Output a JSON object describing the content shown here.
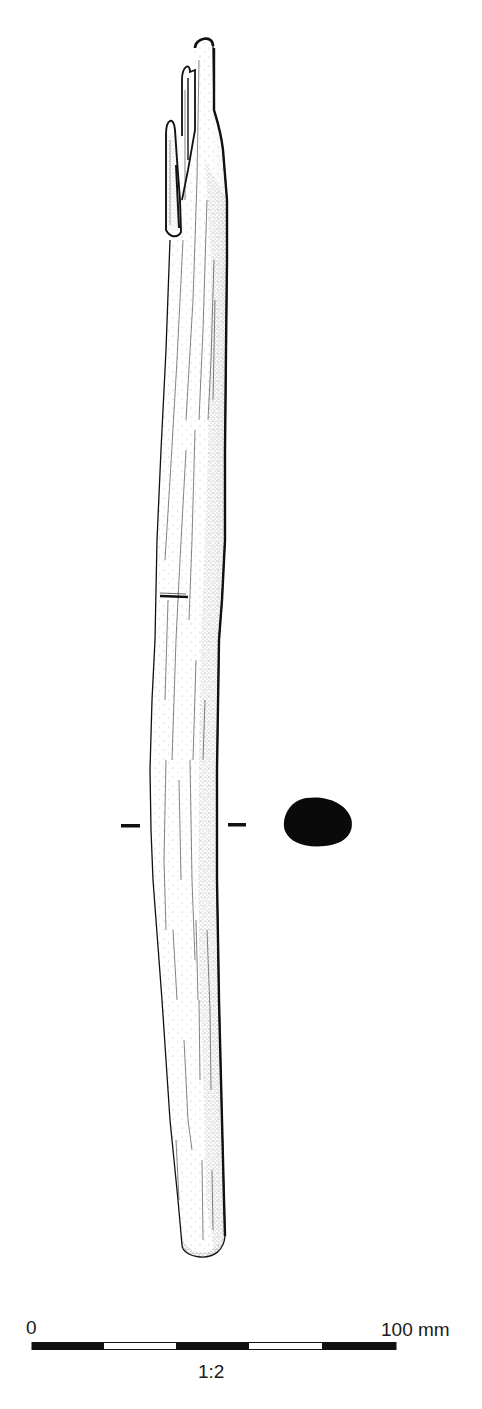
{
  "figure": {
    "section_marker": {
      "y": 826,
      "left_dash": [
        121,
        140
      ],
      "right_dash": [
        228,
        246
      ]
    },
    "cross_section": {
      "fill": "#0a0a0a",
      "bbox": [
        284,
        797,
        353,
        846
      ]
    },
    "cut_mark_y": 596
  },
  "scale_bar": {
    "start_label": "0",
    "end_label": "100 mm",
    "ratio_label": "1:2",
    "x_start": 32,
    "x_end": 396,
    "segments": [
      {
        "from": 32,
        "to": 104,
        "fill": "#111111"
      },
      {
        "from": 104,
        "to": 176,
        "fill": "#ffffff"
      },
      {
        "from": 176,
        "to": 249,
        "fill": "#111111"
      },
      {
        "from": 249,
        "to": 322,
        "fill": "#ffffff"
      },
      {
        "from": 322,
        "to": 396,
        "fill": "#111111"
      }
    ]
  },
  "colors": {
    "ink": "#111111",
    "paper": "#ffffff",
    "stipple": "#555555"
  }
}
